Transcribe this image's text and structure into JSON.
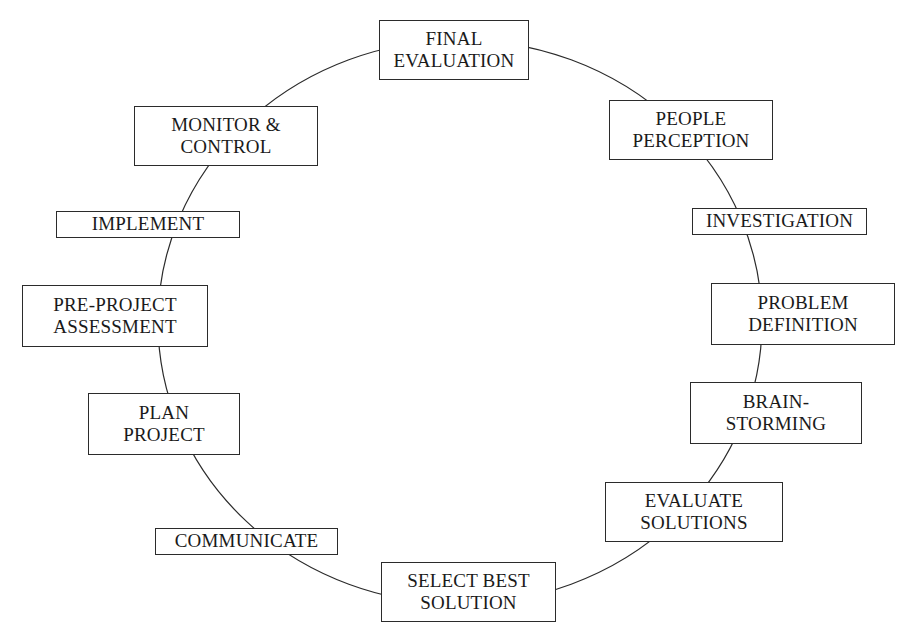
{
  "diagram": {
    "type": "circular-process-cycle",
    "shape": "ring",
    "background_color": "#ffffff",
    "line_color": "#2b2b2b",
    "text_color": "#1a1a1a",
    "ring": {
      "center_x": 460,
      "center_y": 322,
      "radius_x": 302,
      "radius_y": 282,
      "stroke_width": 1.2
    },
    "node_count": 12,
    "nodes": [
      {
        "id": "final-evaluation",
        "label": "FINAL\nEVALUATION",
        "text": "FINAL EVALUATION",
        "order": 1,
        "x": 379,
        "y": 20,
        "width": 150,
        "height": 60,
        "font_size": 19
      },
      {
        "id": "people-perception",
        "label": "PEOPLE\nPERCEPTION",
        "text": "PEOPLE PERCEPTION",
        "order": 2,
        "x": 609,
        "y": 100,
        "width": 164,
        "height": 60,
        "font_size": 19
      },
      {
        "id": "investigation",
        "label": "INVESTIGATION",
        "text": "INVESTIGATION",
        "order": 3,
        "x": 692,
        "y": 208,
        "width": 175,
        "height": 27,
        "font_size": 19
      },
      {
        "id": "problem-definition",
        "label": "PROBLEM\nDEFINITION",
        "text": "PROBLEM DEFINITION",
        "order": 4,
        "x": 711,
        "y": 283,
        "width": 184,
        "height": 62,
        "font_size": 19
      },
      {
        "id": "brain-storming",
        "label": "BRAIN-\nSTORMING",
        "text": "BRAIN-STORMING",
        "order": 5,
        "x": 690,
        "y": 382,
        "width": 172,
        "height": 62,
        "font_size": 19
      },
      {
        "id": "evaluate-solutions",
        "label": "EVALUATE\nSOLUTIONS",
        "text": "EVALUATE SOLUTIONS",
        "order": 6,
        "x": 605,
        "y": 482,
        "width": 178,
        "height": 60,
        "font_size": 19
      },
      {
        "id": "select-best-solution",
        "label": "SELECT BEST\nSOLUTION",
        "text": "SELECT BEST SOLUTION",
        "order": 7,
        "x": 381,
        "y": 562,
        "width": 175,
        "height": 60,
        "font_size": 19
      },
      {
        "id": "communicate",
        "label": "COMMUNICATE",
        "text": "COMMUNICATE",
        "order": 8,
        "x": 155,
        "y": 528,
        "width": 183,
        "height": 27,
        "font_size": 19
      },
      {
        "id": "plan-project",
        "label": "PLAN\nPROJECT",
        "text": "PLAN PROJECT",
        "order": 9,
        "x": 88,
        "y": 393,
        "width": 152,
        "height": 62,
        "font_size": 19
      },
      {
        "id": "pre-project-assessment",
        "label": "PRE-PROJECT\nASSESSMENT",
        "text": "PRE-PROJECT ASSESSMENT",
        "order": 10,
        "x": 22,
        "y": 285,
        "width": 186,
        "height": 62,
        "font_size": 19
      },
      {
        "id": "implement",
        "label": "IMPLEMENT",
        "text": "IMPLEMENT",
        "order": 11,
        "x": 56,
        "y": 211,
        "width": 184,
        "height": 27,
        "font_size": 19
      },
      {
        "id": "monitor-control",
        "label": "MONITOR &\nCONTROL",
        "text": "MONITOR & CONTROL",
        "order": 12,
        "x": 134,
        "y": 106,
        "width": 184,
        "height": 60,
        "font_size": 19
      }
    ]
  }
}
